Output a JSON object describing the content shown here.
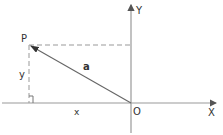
{
  "diagram": {
    "type": "coordinate-vector",
    "colors": {
      "axis": "#888888",
      "vector": "#555555",
      "dashed": "#888888",
      "text": "#333333"
    },
    "labels": {
      "point": "P",
      "vector": "a",
      "y_component": "y",
      "x_component": "x",
      "origin": "O",
      "x_axis": "X",
      "y_axis": "Y"
    },
    "points": {
      "origin": [
        131,
        103
      ],
      "P": [
        29,
        45
      ]
    }
  }
}
